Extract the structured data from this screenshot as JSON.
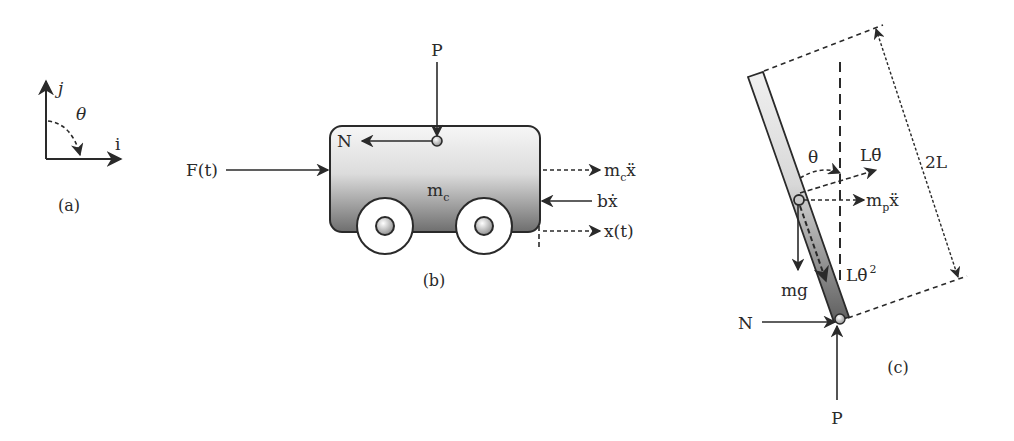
{
  "panels": {
    "a": {
      "caption": "(a)",
      "axis_j": "j",
      "axis_i": "i",
      "angle": "θ"
    },
    "b": {
      "caption": "(b)",
      "force_p": "P",
      "force_n": "N",
      "force_f": "F(t)",
      "mass_base": "m",
      "mass_sub": "c",
      "inertia_base": "m",
      "inertia_sub": "c",
      "inertia_var": "ẍ",
      "damping": "bẋ",
      "displacement": "x(t)"
    },
    "c": {
      "caption": "(c)",
      "angle": "θ",
      "tangential_accel": "Lθ̈",
      "inertia_base": "m",
      "inertia_sub": "p",
      "inertia_var": "ẍ",
      "centripetal_base": "Lθ̇",
      "centripetal_exp": "2",
      "weight": "mg",
      "length": "2L",
      "force_n": "N",
      "force_p": "P"
    }
  },
  "colors": {
    "line": "#2a2a2a",
    "cart_top": "#f4f4f4",
    "cart_bottom": "#6e6e6e",
    "rod_top": "#ececec",
    "rod_bottom": "#6a6a6a"
  }
}
